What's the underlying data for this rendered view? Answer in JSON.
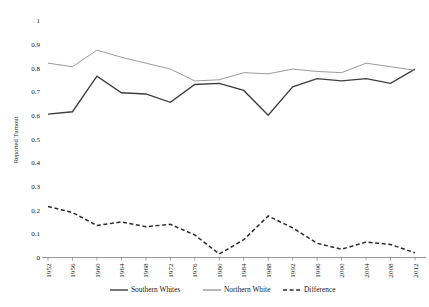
{
  "chart_data": {
    "type": "line",
    "title": "",
    "xlabel": "",
    "ylabel": "Reported Turnout",
    "ylim": [
      0,
      1
    ],
    "ytick_values": [
      0,
      0.1,
      0.2,
      0.3,
      0.4,
      0.5,
      0.6,
      0.7,
      0.8,
      0.9,
      1
    ],
    "ytick_labels": [
      "0",
      "0.1",
      "0.2",
      "0.3",
      "0.4",
      "0.5",
      "0.6",
      "0.7",
      "0.8",
      "0.9",
      "1"
    ],
    "grid": false,
    "legend_position": "bottom",
    "categories": [
      "1952",
      "1956",
      "1960",
      "1964",
      "1968",
      "1972",
      "1976",
      "1980",
      "1984",
      "1988",
      "1992",
      "1996",
      "2000",
      "2004",
      "2008",
      "2012"
    ],
    "x": [
      1952,
      1956,
      1960,
      1964,
      1968,
      1972,
      1976,
      1980,
      1984,
      1988,
      1992,
      1996,
      2000,
      2004,
      2008,
      2012
    ],
    "series": [
      {
        "name": "Southern Whites",
        "style": "solid",
        "color": "#3d3d3d",
        "values": [
          0.605,
          0.615,
          0.765,
          0.695,
          0.69,
          0.655,
          0.73,
          0.735,
          0.705,
          0.6,
          0.72,
          0.755,
          0.745,
          0.755,
          0.735,
          0.795
        ]
      },
      {
        "name": "Northern White",
        "style": "solid",
        "color": "#9a9a9a",
        "values": [
          0.82,
          0.805,
          0.875,
          0.845,
          0.82,
          0.795,
          0.745,
          0.75,
          0.78,
          0.775,
          0.795,
          0.785,
          0.78,
          0.82,
          0.805,
          0.79
        ]
      },
      {
        "name": "Difference",
        "style": "dashed",
        "color": "#2b2b2b",
        "values": [
          0.215,
          0.19,
          0.135,
          0.15,
          0.13,
          0.14,
          0.095,
          0.015,
          0.075,
          0.175,
          0.125,
          0.06,
          0.035,
          0.065,
          0.055,
          0.02
        ]
      }
    ]
  },
  "legend": {
    "entries": [
      {
        "label": "Southern Whites",
        "style": "solid",
        "color": "#3d3d3d"
      },
      {
        "label": "Northern White",
        "style": "solid",
        "color": "#9a9a9a"
      },
      {
        "label": "Difference",
        "style": "dashed",
        "color": "#2b2b2b"
      }
    ]
  }
}
